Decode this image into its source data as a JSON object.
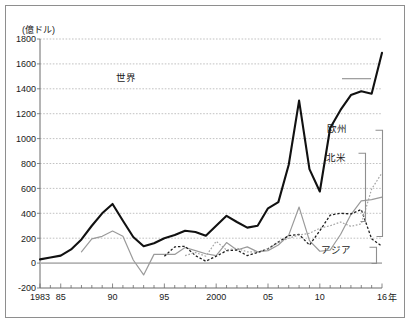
{
  "figure": {
    "unit_label": "(億ドル)",
    "x_axis_unit": "年"
  },
  "chart_data": {
    "type": "line",
    "title": "",
    "subtitle": "",
    "xlabel": "年",
    "ylabel": "億ドル",
    "unit_note": "(億ドル)",
    "grid": true,
    "legend_position": "inline-right",
    "xlim": [
      1983,
      2016
    ],
    "ylim": [
      -200,
      1800
    ],
    "ytick_step": 200,
    "yticks": [
      1800,
      1600,
      1400,
      1200,
      1000,
      800,
      600,
      400,
      200,
      0,
      -200
    ],
    "ytick_labels": [
      "1800",
      "1600",
      "1400",
      "1200",
      "1000",
      "800",
      "600",
      "400",
      "200",
      "0",
      "-200"
    ],
    "xticks": [
      1983,
      1985,
      1990,
      1995,
      2000,
      2005,
      2010,
      2016
    ],
    "xtick_labels": [
      "1983",
      "85",
      "90",
      "95",
      "2000",
      "05",
      "10",
      "16"
    ],
    "x": [
      1983,
      1984,
      1985,
      1986,
      1987,
      1988,
      1989,
      1990,
      1991,
      1992,
      1993,
      1994,
      1995,
      1996,
      1997,
      1998,
      1999,
      2000,
      2001,
      2002,
      2003,
      2004,
      2005,
      2006,
      2007,
      2008,
      2009,
      2010,
      2011,
      2012,
      2013,
      2014,
      2015,
      2016
    ],
    "series": [
      {
        "name": "世界",
        "label": "世界",
        "style": "solid-thick-black",
        "color": "#111111",
        "values": [
          30,
          45,
          60,
          110,
          190,
          300,
          400,
          475,
          340,
          210,
          135,
          160,
          200,
          225,
          260,
          250,
          220,
          300,
          380,
          330,
          285,
          300,
          440,
          490,
          790,
          1305,
          755,
          575,
          1085,
          1230,
          1350,
          1380,
          1360,
          1690
        ]
      },
      {
        "name": "北米",
        "label": "北米",
        "style": "solid-thin-gray",
        "color": "#9a9a9a",
        "values": [
          0,
          0,
          0,
          0,
          90,
          195,
          215,
          258,
          215,
          25,
          -95,
          70,
          70,
          70,
          125,
          100,
          75,
          60,
          165,
          105,
          130,
          90,
          100,
          145,
          225,
          450,
          180,
          95,
          105,
          230,
          390,
          500,
          510,
          530
        ]
      },
      {
        "name": "欧州",
        "label": "欧州",
        "style": "dashed-black",
        "color": "#1f1f1f",
        "values": [
          0,
          0,
          0,
          0,
          0,
          0,
          0,
          0,
          0,
          0,
          10,
          20,
          55,
          130,
          135,
          60,
          15,
          55,
          100,
          105,
          60,
          85,
          115,
          170,
          220,
          230,
          145,
          260,
          385,
          400,
          395,
          430,
          195,
          135
        ]
      },
      {
        "name": "アジア",
        "label": "アジア",
        "style": "dotted-gray",
        "color": "#a5a5a5",
        "values": [
          0,
          0,
          0,
          0,
          0,
          0,
          0,
          0,
          0,
          0,
          0,
          0,
          10,
          20,
          60,
          85,
          55,
          175,
          105,
          120,
          90,
          90,
          115,
          165,
          200,
          225,
          240,
          280,
          300,
          330,
          295,
          315,
          595,
          725
        ]
      }
    ],
    "annotations": [
      {
        "label": "世界",
        "x": 1991.3,
        "y": 1490
      },
      {
        "label": "欧州",
        "x": 2011.7,
        "y": 1080
      },
      {
        "label": "北米",
        "x": 2011.6,
        "y": 845
      },
      {
        "label": "アジア",
        "x": 2011.6,
        "y": 105
      }
    ]
  }
}
